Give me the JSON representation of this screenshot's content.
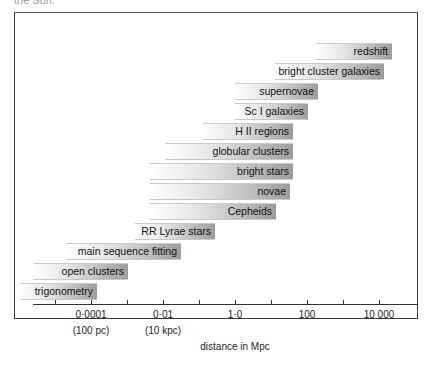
{
  "page": {
    "caption_fragment": "the Sun."
  },
  "chart_data": {
    "type": "bar",
    "orientation": "horizontal-range",
    "title": "",
    "xlabel": "distance in Mpc",
    "ylabel": "",
    "x_scale": "log",
    "xlim_log10": [
      -6,
      4.5
    ],
    "x_ticks": [
      {
        "value_log10": -5,
        "label": ""
      },
      {
        "value_log10": -4,
        "label": "0·0001",
        "sublabel": "(100 pc)"
      },
      {
        "value_log10": -3,
        "label": ""
      },
      {
        "value_log10": -2,
        "label": "0·01",
        "sublabel": "(10 kpc)"
      },
      {
        "value_log10": -1,
        "label": ""
      },
      {
        "value_log10": 0,
        "label": "1·0"
      },
      {
        "value_log10": 1,
        "label": ""
      },
      {
        "value_log10": 2,
        "label": "100"
      },
      {
        "value_log10": 3,
        "label": ""
      },
      {
        "value_log10": 4,
        "label": "10 000"
      }
    ],
    "series": [
      {
        "name": "redshift",
        "range_log10": [
          2.0,
          4.0
        ]
      },
      {
        "name": "bright cluster galaxies",
        "range_log10": [
          1.4,
          3.8
        ]
      },
      {
        "name": "supernovae",
        "range_log10": [
          -0.2,
          2.1
        ]
      },
      {
        "name": "Sc I galaxies",
        "range_log10": [
          -0.2,
          1.6
        ]
      },
      {
        "name": "H II regions",
        "range_log10": [
          -0.9,
          1.1
        ]
      },
      {
        "name": "globular clusters",
        "range_log10": [
          -1.6,
          0.6
        ]
      },
      {
        "name": "bright stars",
        "range_log10": [
          -2.5,
          0.6
        ]
      },
      {
        "name": "novae",
        "range_log10": [
          -2.5,
          0.5
        ]
      },
      {
        "name": "Cepheids",
        "range_log10": [
          -2.5,
          0.1
        ]
      },
      {
        "name": "RR Lyrae stars",
        "range_log10": [
          -3.4,
          -1.0
        ]
      },
      {
        "name": "main sequence fitting",
        "range_log10": [
          -4.6,
          -1.5
        ]
      },
      {
        "name": "open clusters",
        "range_log10": [
          -5.5,
          -3.7
        ]
      },
      {
        "name": "trigonometry",
        "range_log10": [
          -6.0,
          -4.0
        ]
      }
    ],
    "grid": false,
    "legend": "none (labels on bars)"
  },
  "bars": [
    {
      "label": "redshift",
      "left": 301,
      "top": 54,
      "width": 76
    },
    {
      "label": "bright cluster galaxies",
      "left": 260,
      "top": 74,
      "width": 109
    },
    {
      "label": "supernovae",
      "left": 220,
      "top": 94,
      "width": 83
    },
    {
      "label": "Sc I galaxies",
      "left": 220,
      "top": 114,
      "width": 73
    },
    {
      "label": "H II regions",
      "left": 188,
      "top": 134,
      "width": 90
    },
    {
      "label": "globular clusters",
      "left": 150,
      "top": 154,
      "width": 128
    },
    {
      "label": "bright stars",
      "left": 135,
      "top": 174,
      "width": 143
    },
    {
      "label": "novae",
      "left": 135,
      "top": 194,
      "width": 140
    },
    {
      "label": "Cepheids",
      "left": 135,
      "top": 214,
      "width": 126
    },
    {
      "label": "RR Lyrae stars",
      "left": 120,
      "top": 234,
      "width": 80
    },
    {
      "label": "main sequence fitting",
      "left": 51,
      "top": 254,
      "width": 115
    },
    {
      "label": "open clusters",
      "left": 18,
      "top": 274,
      "width": 95
    },
    {
      "label": "trigonometry",
      "left": 5,
      "top": 294,
      "width": 77
    }
  ],
  "axis": {
    "title": "distance in Mpc",
    "ticks": [
      {
        "x": 40,
        "label": ""
      },
      {
        "x": 76,
        "label": "0·0001",
        "sub": "(100 pc)"
      },
      {
        "x": 112,
        "label": ""
      },
      {
        "x": 148,
        "label": "0·01",
        "sub": "(10 kpc)"
      },
      {
        "x": 184,
        "label": ""
      },
      {
        "x": 220,
        "label": "1·0"
      },
      {
        "x": 256,
        "label": ""
      },
      {
        "x": 292,
        "label": "100"
      },
      {
        "x": 328,
        "label": ""
      },
      {
        "x": 364,
        "label": "10 000"
      }
    ]
  }
}
